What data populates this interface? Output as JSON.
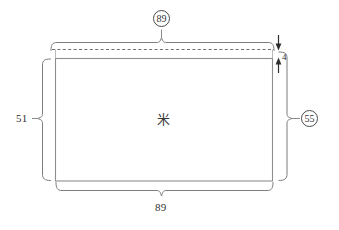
{
  "figure": {
    "type": "patent-technical-drawing",
    "background_color": "#ffffff",
    "line_color": "#8c8c8c",
    "annotation_color": "#4a4a4a",
    "text_color": "#323232",
    "labels": {
      "top_width_circled": "89",
      "bottom_width": "89",
      "left_height": "51",
      "right_height_circled": "55",
      "gap_dimension": "4",
      "center_symbol": "米"
    },
    "elements": {
      "rectangle_name": "main-rectangle",
      "dashed_line_name": "dashed-reference-line",
      "top_brace_name": "top-dimension-brace",
      "bottom_brace_name": "bottom-dimension-brace",
      "left_brace_name": "left-dimension-brace",
      "right_brace_name": "right-dimension-brace",
      "gap_arrows_name": "gap-dimension-arrows"
    }
  }
}
